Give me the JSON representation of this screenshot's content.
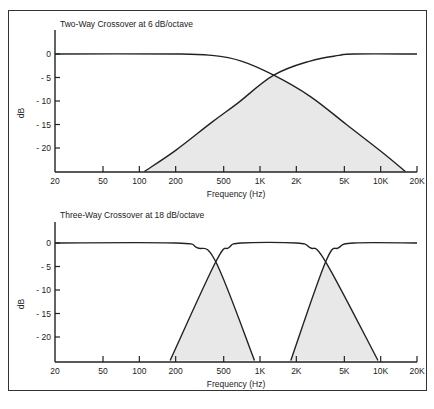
{
  "chart_data": [
    {
      "type": "line",
      "title": "Two-Way Crossover at 6 dB/octave",
      "xlabel": "Frequency (Hz)",
      "ylabel": "dB",
      "x_scale": "log",
      "xlim": [
        20,
        20000
      ],
      "ylim": [
        -25,
        3
      ],
      "x_ticks": [
        20,
        50,
        100,
        200,
        500,
        1000,
        2000,
        5000,
        10000,
        20000
      ],
      "x_tick_labels": [
        "20",
        "50",
        "100",
        "200",
        "500",
        "1K",
        "2K",
        "5K",
        "10K",
        "20K"
      ],
      "y_ticks": [
        0,
        -5,
        -10,
        -15,
        -20
      ],
      "y_tick_labels": [
        "0",
        "- 5",
        "- 10",
        "- 15",
        "- 20"
      ],
      "crossover_hz": [
        1300
      ],
      "series": [
        {
          "name": "Low-pass",
          "x": [
            20,
            200,
            400,
            700,
            1300,
            2600,
            5200,
            10400,
            16000
          ],
          "y": [
            0,
            0,
            -0.3,
            -1.5,
            -4.5,
            -9,
            -15,
            -21,
            -25
          ]
        },
        {
          "name": "High-pass",
          "x": [
            110,
            200,
            400,
            650,
            1300,
            2600,
            4500,
            6000,
            20000
          ],
          "y": [
            -25,
            -20.5,
            -14.5,
            -10.5,
            -4.5,
            -1.5,
            -0.3,
            0,
            0
          ]
        }
      ],
      "shaded_region": "overlap between high-pass and low-pass slopes below crossover point",
      "grid": false
    },
    {
      "type": "line",
      "title": "Three-Way Crossover at 18 dB/octave",
      "xlabel": "Frequency (Hz)",
      "ylabel": "dB",
      "x_scale": "log",
      "xlim": [
        20,
        20000
      ],
      "ylim": [
        -25,
        3
      ],
      "x_ticks": [
        20,
        50,
        100,
        200,
        500,
        1000,
        2000,
        5000,
        10000,
        20000
      ],
      "x_tick_labels": [
        "20",
        "50",
        "100",
        "200",
        "500",
        "1K",
        "2K",
        "5K",
        "10K",
        "20K"
      ],
      "y_ticks": [
        0,
        -5,
        -10,
        -15,
        -20
      ],
      "y_tick_labels": [
        "0",
        "- 5",
        "- 10",
        "- 15",
        "- 20"
      ],
      "crossover_hz": [
        430,
        3500
      ],
      "series": [
        {
          "name": "Low-pass",
          "x": [
            20,
            200,
            300,
            430,
            900
          ],
          "y": [
            0,
            0,
            -1,
            -4,
            -25
          ]
        },
        {
          "name": "Band-pass",
          "x": [
            180,
            430,
            550,
            700,
            2000,
            2600,
            3500,
            9500
          ],
          "y": [
            -25,
            -4,
            -1,
            0,
            0,
            -1,
            -4,
            -25
          ]
        },
        {
          "name": "High-pass",
          "x": [
            1800,
            3500,
            4500,
            6000,
            20000
          ],
          "y": [
            -25,
            -4,
            -1,
            0,
            0
          ]
        }
      ],
      "shaded_region": "overlap regions around each crossover point",
      "grid": false
    }
  ]
}
